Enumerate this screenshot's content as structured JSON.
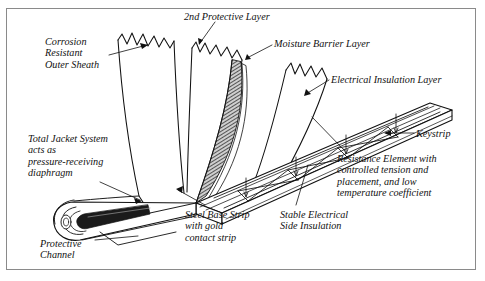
{
  "figure": {
    "kind": "technical-cutaway-diagram",
    "frame_border_color": "#8a8a8a",
    "background_color": "#ffffff",
    "ink_color": "#111111"
  },
  "labels": [
    {
      "id": "corrosion-resistant-outer-sheath",
      "text": "Corrosion\nResistant\nOuter Sheath",
      "x": 45,
      "y": 36,
      "align": "left"
    },
    {
      "id": "second-protective-layer",
      "text": "2nd Protective Layer",
      "x": 184,
      "y": 11,
      "align": "left"
    },
    {
      "id": "moisture-barrier-layer",
      "text": "Moisture Barrier Layer",
      "x": 274,
      "y": 38,
      "align": "left"
    },
    {
      "id": "electrical-insulation-layer",
      "text": "Electrical Insulation Layer",
      "x": 331,
      "y": 74,
      "align": "left"
    },
    {
      "id": "keystrip",
      "text": "Keystrip",
      "x": 416,
      "y": 128,
      "align": "left"
    },
    {
      "id": "resistance-element",
      "text": "Resistance Element with\ncontrolled tension and\nplacement, and low\ntemperature coefficient",
      "x": 337,
      "y": 153,
      "align": "left"
    },
    {
      "id": "total-jacket-system",
      "text": "Total Jacket System\nacts as\npressure-receiving\ndiaphragm",
      "x": 28,
      "y": 133,
      "align": "left"
    },
    {
      "id": "protective-channel",
      "text": "Protective\nChannel",
      "x": 40,
      "y": 238,
      "align": "left"
    },
    {
      "id": "steel-base-strip",
      "text": "Steel Base Strip\nwith gold\ncontact strip",
      "x": 185,
      "y": 209,
      "align": "left"
    },
    {
      "id": "stable-electrical-side-insulation",
      "text": "Stable Electrical\nSide Insulation",
      "x": 280,
      "y": 209,
      "align": "left"
    }
  ]
}
